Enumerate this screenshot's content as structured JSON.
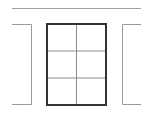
{
  "diagram": {
    "colors": {
      "background": "#ffffff",
      "center_border": "#333333",
      "grid_lines": "#8a8a8a",
      "side_pages": "#9a9a9a",
      "top_rule": "#a0a0a0"
    },
    "grid": {
      "columns": 2,
      "rows": 3
    },
    "top_rule": {
      "x1": 12,
      "x2": 141,
      "y": 8
    },
    "center_page": {
      "x": 47,
      "y": 24,
      "width": 59,
      "height": 81
    },
    "left_page": {
      "x_left": 12,
      "x_right": 31,
      "y_top": 24,
      "y_bottom": 104
    },
    "right_page": {
      "x_left": 122,
      "x_right": 141,
      "y_top": 24,
      "y_bottom": 104
    }
  }
}
